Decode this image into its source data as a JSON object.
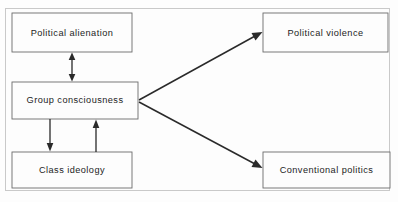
{
  "diagram": {
    "background_color": "#fdfdfd",
    "line_color": "#2a2a2a",
    "box_border_color": "#6b6b6b",
    "frame_color": "#c9c9c9",
    "nodes": [
      {
        "id": "political-alienation",
        "label": "Political alienation",
        "x": 12,
        "y": 13,
        "width": 120,
        "height": 39
      },
      {
        "id": "group-consciousness",
        "label": "Group consciousness",
        "x": 12,
        "y": 82,
        "width": 126,
        "height": 37
      },
      {
        "id": "class-ideology",
        "label": "Class ideology",
        "x": 12,
        "y": 152,
        "width": 120,
        "height": 36
      },
      {
        "id": "political-violence",
        "label": "Political violence",
        "x": 263,
        "y": 13,
        "width": 125,
        "height": 39
      },
      {
        "id": "conventional-politics",
        "label": "Conventional politics",
        "x": 263,
        "y": 152,
        "width": 127,
        "height": 36
      }
    ],
    "edges": [
      {
        "id": "alienation-consciousness",
        "from": "political-alienation",
        "to": "group-consciousness",
        "style": "double-headed-vertical",
        "direction": "bidirectional"
      },
      {
        "id": "consciousness-ideology",
        "from": "group-consciousness",
        "to": "class-ideology",
        "style": "vertical",
        "direction": "down"
      },
      {
        "id": "ideology-consciousness",
        "from": "class-ideology",
        "to": "group-consciousness",
        "style": "vertical",
        "direction": "up"
      },
      {
        "id": "consciousness-violence",
        "from": "group-consciousness",
        "to": "political-violence",
        "style": "diagonal",
        "direction": "up-right"
      },
      {
        "id": "consciousness-conventional",
        "from": "group-consciousness",
        "to": "conventional-politics",
        "style": "diagonal",
        "direction": "down-right"
      }
    ]
  }
}
